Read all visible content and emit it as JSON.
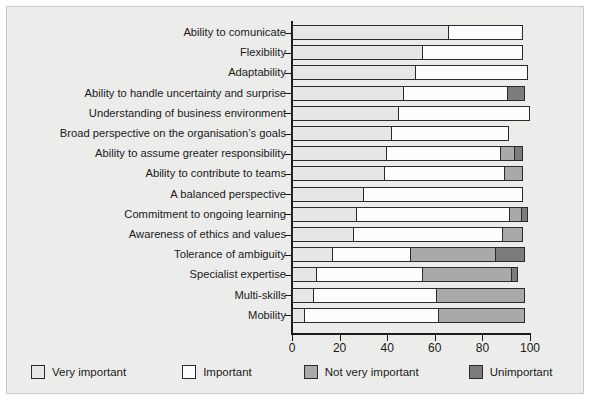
{
  "chart_data": {
    "type": "bar",
    "orientation": "horizontal",
    "stacked": true,
    "title": "",
    "xlabel": "",
    "ylabel": "",
    "xlim": [
      0,
      100
    ],
    "xticks": [
      0,
      20,
      40,
      60,
      80,
      100
    ],
    "grid": false,
    "legend_position": "bottom",
    "series": [
      {
        "name": "Very important",
        "color": "#e6e6e4",
        "values": [
          66,
          55,
          52,
          47,
          45,
          42,
          40,
          39,
          30,
          27,
          26,
          17,
          10,
          9,
          5
        ]
      },
      {
        "name": "Important",
        "color": "#fdfdfd",
        "values": [
          31,
          42,
          47,
          44,
          55,
          49,
          48,
          51,
          67,
          65,
          63,
          33,
          45,
          52,
          57
        ]
      },
      {
        "name": "Not very important",
        "color": "#a9a9a7",
        "values": [
          0,
          0,
          0,
          0,
          0,
          0,
          6,
          7,
          0,
          5,
          8,
          36,
          38,
          37,
          36
        ]
      },
      {
        "name": "Unimportant",
        "color": "#7c7c7a",
        "values": [
          0,
          0,
          0,
          7,
          0,
          0,
          3,
          0,
          0,
          2,
          0,
          12,
          2,
          0,
          0
        ]
      }
    ],
    "categories": [
      "Ability to comunicate",
      "Flexibility",
      "Adaptability",
      "Ability to handle uncertainty and surprise",
      "Understanding of business environment",
      "Broad perspective on the organisation’s goals",
      "Ability to assume greater responsibility",
      "Ability to contribute to teams",
      "A balanced perspective",
      "Commitment to ongoing learning",
      "Awareness of ethics and values",
      "Tolerance of ambiguity",
      "Specialist expertise",
      "Multi-skills",
      "Mobility"
    ]
  },
  "legend": {
    "items": [
      {
        "label": "Very important"
      },
      {
        "label": "Important"
      },
      {
        "label": "Not very important"
      },
      {
        "label": "Unimportant"
      }
    ]
  },
  "axis": {
    "tick_labels": [
      "0",
      "20",
      "40",
      "60",
      "80",
      "100"
    ]
  }
}
